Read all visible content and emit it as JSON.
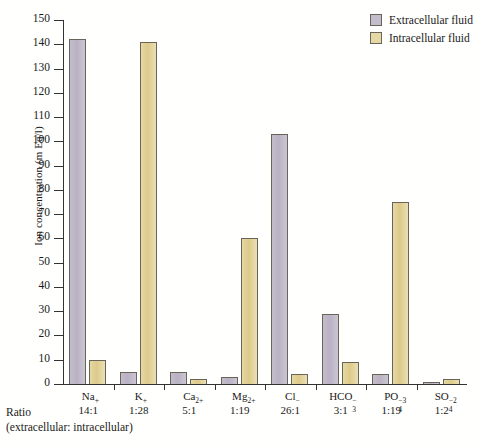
{
  "chart_data": {
    "type": "bar",
    "title": "",
    "xlabel": "",
    "ylabel": "Ion concentration (m Eq/l)",
    "ylim": [
      0,
      150
    ],
    "ytick_step": 10,
    "yticks": [
      150,
      140,
      130,
      120,
      110,
      100,
      90,
      80,
      70,
      60,
      50,
      40,
      30,
      20,
      10,
      0
    ],
    "grid": false,
    "legend_position": "top-right",
    "categories": [
      "Na+",
      "K+",
      "Ca2+",
      "Mg2+",
      "Cl-",
      "HCO3-",
      "PO4-3",
      "SO4-2"
    ],
    "series": [
      {
        "name": "Extracellular fluid",
        "color": "#bdb6c6",
        "values": [
          142,
          5,
          5,
          3,
          103,
          29,
          4,
          1
        ]
      },
      {
        "name": "Intracellular fluid",
        "color": "#e3d08e",
        "values": [
          10,
          141,
          2,
          60,
          4,
          9,
          75,
          2
        ]
      }
    ],
    "ratios": [
      "14:1",
      "1:28",
      "5:1",
      "1:19",
      "26:1",
      "3:1",
      "1:19",
      "1:2"
    ]
  },
  "axis": {
    "y_label": "Ion concentration (m Eq/l)",
    "y_ticks": [
      "150",
      "140",
      "130",
      "120",
      "110",
      "100",
      "90",
      "80",
      "70",
      "60",
      "50",
      "40",
      "30",
      "20",
      "10",
      "0"
    ]
  },
  "legend": {
    "items": [
      {
        "label": "Extracellular fluid",
        "swatch": "extra"
      },
      {
        "label": "Intracellular fluid",
        "swatch": "intra"
      }
    ]
  },
  "ratio_caption": {
    "line1": "Ratio",
    "line2": "(extracellular: intracellular)"
  },
  "x_labels": [
    {
      "base": "Na",
      "sup": "+",
      "sub": "",
      "ratio": "14:1"
    },
    {
      "base": "K",
      "sup": "+",
      "sub": "",
      "ratio": "1:28"
    },
    {
      "base": "Ca",
      "sup": "2+",
      "sub": "",
      "ratio": "5:1"
    },
    {
      "base": "Mg",
      "sup": "2+",
      "sub": "",
      "ratio": "1:19"
    },
    {
      "base": "Cl",
      "sup": "−",
      "sub": "",
      "ratio": "26:1"
    },
    {
      "base": "HCO",
      "sup": "−",
      "sub": "3",
      "ratio": "3:1"
    },
    {
      "base": "PO",
      "sup": "−3",
      "sub": "4",
      "ratio": "1:19"
    },
    {
      "base": "SO",
      "sup": "−2",
      "sub": "4",
      "ratio": "1:2"
    }
  ]
}
